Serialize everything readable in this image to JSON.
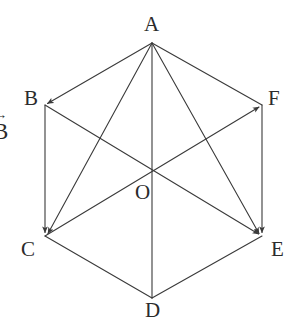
{
  "figure": {
    "background_color": "#ffffff",
    "stroke_color": "#3a3a3a",
    "label_color": "#2b2b2b",
    "stroke_width": 1
  },
  "vertices": [
    {
      "id": "A",
      "label": "A",
      "x": 152,
      "y": 43,
      "label_x": 144,
      "label_y": 14,
      "arrowhead": true
    },
    {
      "id": "B",
      "label": "B",
      "x": 45,
      "y": 105,
      "label_x": 24,
      "label_y": 88,
      "arrowhead": true
    },
    {
      "id": "C",
      "label": "C",
      "x": 45,
      "y": 236,
      "label_x": 21,
      "label_y": 239,
      "arrowhead": true
    },
    {
      "id": "D",
      "label": "D",
      "x": 152,
      "y": 298,
      "label_x": 145,
      "label_y": 300,
      "arrowhead": false
    },
    {
      "id": "E",
      "label": "E",
      "x": 262,
      "y": 236,
      "label_x": 271,
      "label_y": 239,
      "arrowhead": true
    },
    {
      "id": "F",
      "label": "F",
      "x": 262,
      "y": 105,
      "label_x": 268,
      "label_y": 88,
      "arrowhead": false
    },
    {
      "id": "O",
      "label": "O",
      "x": 152,
      "y": 172,
      "label_x": 135,
      "label_y": 182,
      "arrowhead": false
    }
  ],
  "edges": [
    {
      "id": "A-B",
      "from": "A",
      "to": "B",
      "arrow": true,
      "kind": "side"
    },
    {
      "id": "A-F",
      "from": "A",
      "to": "F",
      "arrow": false,
      "kind": "side"
    },
    {
      "id": "B-C",
      "from": "B",
      "to": "C",
      "arrow": true,
      "kind": "side"
    },
    {
      "id": "F-E",
      "from": "F",
      "to": "E",
      "arrow": true,
      "kind": "side"
    },
    {
      "id": "C-D",
      "from": "C",
      "to": "D",
      "arrow": false,
      "kind": "side"
    },
    {
      "id": "D-E",
      "from": "D",
      "to": "E",
      "arrow": false,
      "kind": "side"
    },
    {
      "id": "A-C",
      "from": "A",
      "to": "C",
      "arrow": true,
      "kind": "diagonal"
    },
    {
      "id": "A-E",
      "from": "A",
      "to": "E",
      "arrow": true,
      "kind": "diagonal"
    },
    {
      "id": "A-D",
      "from": "A",
      "to": "D",
      "arrow": false,
      "kind": "long-diagonal"
    },
    {
      "id": "B-E",
      "from": "B",
      "to": "E",
      "arrow": true,
      "kind": "long-diagonal"
    },
    {
      "id": "C-F",
      "from": "C",
      "to": "F",
      "arrow": true,
      "kind": "long-diagonal"
    }
  ],
  "annotations": {
    "left_vector": {
      "text": "B",
      "arrow_glyph": "→",
      "note": "vector label clipped at left edge",
      "x": -6,
      "y": 112
    }
  }
}
